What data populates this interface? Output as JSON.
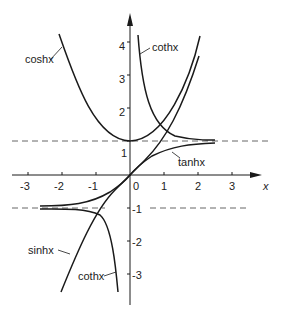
{
  "diagram": {
    "axes": {
      "x_label": "x",
      "x_ticks": [
        "-3",
        "-2",
        "-1",
        "0",
        "1",
        "2",
        "3"
      ],
      "y_ticks_pos": [
        "1",
        "2",
        "3",
        "4"
      ],
      "y_ticks_neg": [
        "-1",
        "-2",
        "-3"
      ],
      "asymptotes": [
        "y = 1",
        "y = -1"
      ]
    },
    "curve_labels": {
      "cosh_left": "coshx",
      "coth_pos": "cothx",
      "tanh": "tanhx",
      "sinh": "sinhx",
      "coth_neg": "cothx"
    },
    "colors": {
      "curve": "#1a1a1a",
      "axis": "#1a1a1a",
      "dashed": "#666666"
    }
  }
}
